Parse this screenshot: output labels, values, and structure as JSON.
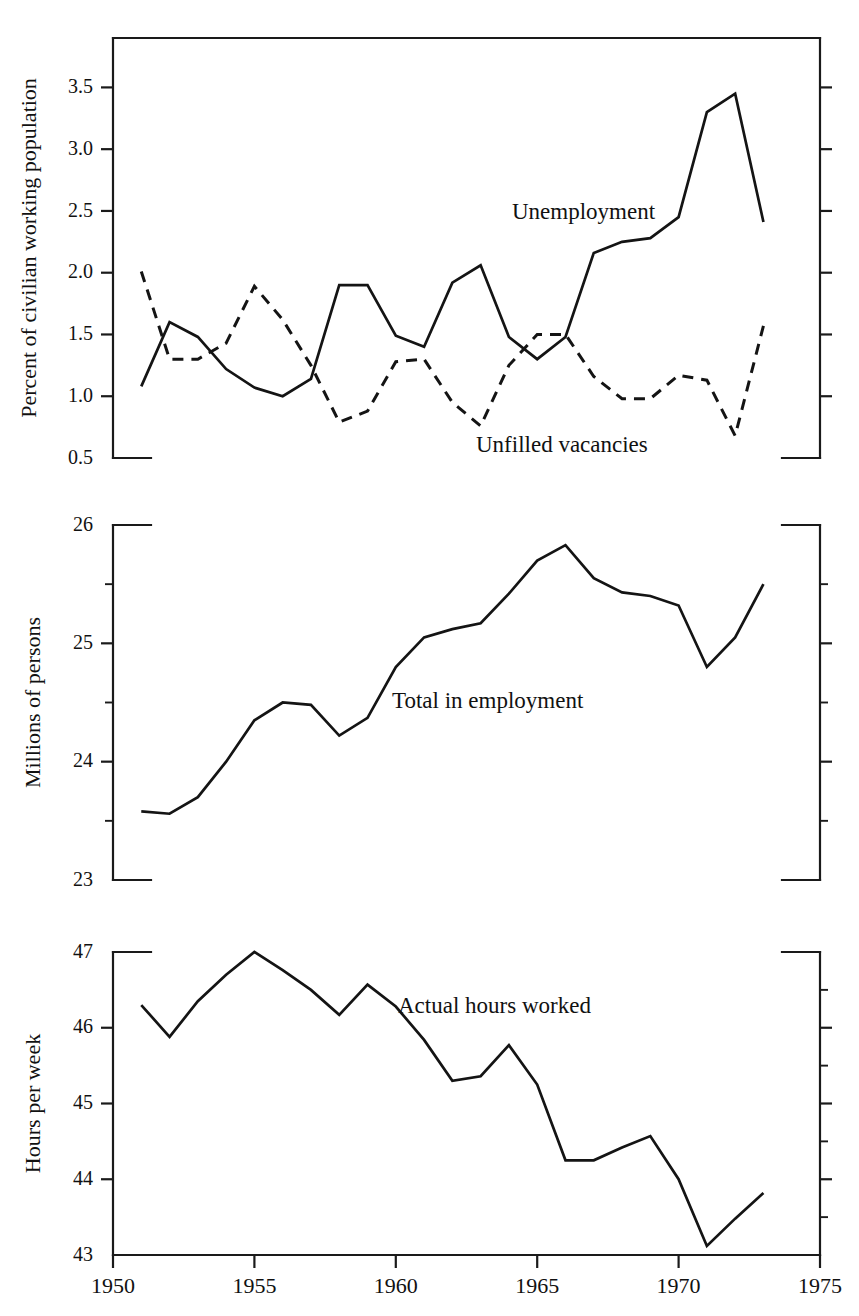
{
  "figure": {
    "background_color": "#ffffff",
    "line_color": "#141414",
    "panel_count": 3
  },
  "xaxis": {
    "label": "",
    "ticks": [
      "1950",
      "1955",
      "1960",
      "1965",
      "1970",
      "1975"
    ],
    "tick_values": [
      1950,
      1955,
      1960,
      1965,
      1970,
      1975
    ],
    "range": [
      1950,
      1975
    ]
  },
  "panel1": {
    "ylabel": "Percent of civilian working population",
    "yticks": [
      "3.5",
      "3.0",
      "2.5",
      "2.0",
      "1.5",
      "1.0",
      "0.5"
    ],
    "ytick_values": [
      3.5,
      3.0,
      2.5,
      2.0,
      1.5,
      1.0,
      0.5
    ],
    "ylim": [
      0.5,
      3.9
    ],
    "series_label_unemployment": "Unemployment",
    "series_label_vacancies": "Unfilled vacancies"
  },
  "panel2": {
    "ylabel": "Millions of persons",
    "yticks": [
      "26",
      "25",
      "24",
      "23"
    ],
    "ytick_values": [
      26,
      25,
      24,
      23
    ],
    "minor_ytick_values": [
      25.5,
      24.5,
      23.5
    ],
    "ylim": [
      23,
      26
    ],
    "series_label_employment": "Total in employment"
  },
  "panel3": {
    "ylabel": "Hours per week",
    "yticks": [
      "47",
      "46",
      "45",
      "44",
      "43"
    ],
    "ytick_values": [
      47,
      46,
      45,
      44,
      43
    ],
    "ylim": [
      43,
      47
    ],
    "series_label_hours": "Actual hours worked"
  },
  "chart_data": [
    {
      "type": "line",
      "panel": 1,
      "title": "",
      "xlabel": "",
      "ylabel": "Percent of civilian working population",
      "ylim": [
        0.5,
        3.9
      ],
      "xlim": [
        1950,
        1975
      ],
      "grid": false,
      "legend": "inline-annotation",
      "x": [
        1951,
        1952,
        1953,
        1954,
        1955,
        1956,
        1957,
        1958,
        1959,
        1960,
        1961,
        1962,
        1963,
        1964,
        1965,
        1966,
        1967,
        1968,
        1969,
        1970,
        1971,
        1972,
        1973
      ],
      "series": [
        {
          "name": "Unemployment",
          "style": "solid",
          "values": [
            1.08,
            1.6,
            1.48,
            1.22,
            1.07,
            1.0,
            1.14,
            1.9,
            1.9,
            1.49,
            1.4,
            1.92,
            2.06,
            1.48,
            1.3,
            1.48,
            2.16,
            2.25,
            2.28,
            2.45,
            3.3,
            3.45,
            2.41
          ]
        },
        {
          "name": "Unfilled vacancies",
          "style": "dashed",
          "values": [
            2.01,
            1.3,
            1.3,
            1.43,
            1.89,
            1.62,
            1.25,
            0.79,
            0.88,
            1.28,
            1.3,
            0.95,
            0.76,
            1.25,
            1.5,
            1.5,
            1.16,
            0.98,
            0.98,
            1.17,
            1.13,
            0.68,
            1.57
          ]
        }
      ]
    },
    {
      "type": "line",
      "panel": 2,
      "title": "",
      "xlabel": "",
      "ylabel": "Millions of persons",
      "ylim": [
        23,
        26
      ],
      "xlim": [
        1950,
        1975
      ],
      "grid": false,
      "legend": "inline-annotation",
      "x": [
        1951,
        1952,
        1953,
        1954,
        1955,
        1956,
        1957,
        1958,
        1959,
        1960,
        1961,
        1962,
        1963,
        1964,
        1965,
        1966,
        1967,
        1968,
        1969,
        1970,
        1971,
        1972,
        1973
      ],
      "series": [
        {
          "name": "Total in employment",
          "style": "solid",
          "values": [
            23.58,
            23.56,
            23.7,
            24.0,
            24.35,
            24.5,
            24.48,
            24.22,
            24.37,
            24.8,
            25.05,
            25.12,
            25.17,
            25.42,
            25.7,
            25.83,
            25.55,
            25.43,
            25.4,
            25.32,
            24.8,
            25.05,
            25.5
          ]
        }
      ]
    },
    {
      "type": "line",
      "panel": 3,
      "title": "",
      "xlabel": "",
      "ylabel": "Hours per week",
      "ylim": [
        43,
        47
      ],
      "xlim": [
        1950,
        1975
      ],
      "grid": false,
      "legend": "inline-annotation",
      "x": [
        1951,
        1952,
        1953,
        1954,
        1955,
        1956,
        1957,
        1958,
        1959,
        1960,
        1961,
        1962,
        1963,
        1964,
        1965,
        1966,
        1967,
        1968,
        1969,
        1970,
        1971,
        1972,
        1973
      ],
      "series": [
        {
          "name": "Actual hours worked",
          "style": "solid",
          "values": [
            46.3,
            45.88,
            46.35,
            46.7,
            47.0,
            46.76,
            46.5,
            46.17,
            46.57,
            46.28,
            45.84,
            45.3,
            45.36,
            45.77,
            45.25,
            44.25,
            44.25,
            44.42,
            44.57,
            44.0,
            43.12,
            43.48,
            43.82
          ]
        }
      ]
    }
  ]
}
